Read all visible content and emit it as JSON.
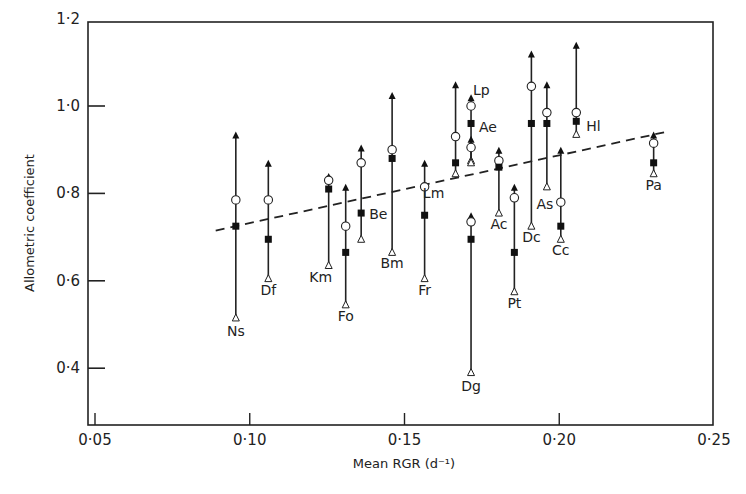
{
  "chart_data": {
    "type": "scatter",
    "title": "",
    "xlabel": "Mean RGR (d⁻¹)",
    "ylabel": "Allometric coefficient",
    "xlim": [
      0.048,
      0.25
    ],
    "ylim": [
      0.28,
      1.2
    ],
    "x_ticks": [
      0.05,
      0.1,
      0.15,
      0.2,
      0.25
    ],
    "x_tick_labels": [
      "0·05",
      "0·10",
      "0·15",
      "0·20",
      "0·25"
    ],
    "y_ticks": [
      0.4,
      0.6,
      0.8,
      1.0,
      1.2
    ],
    "y_tick_labels": [
      "0·4",
      "0·6",
      "0·8",
      "1·0",
      "1·2"
    ],
    "grid": false,
    "legend": null,
    "markers": {
      "upper": "filled-up-triangle",
      "circle": "open-circle",
      "square": "filled-square",
      "lower": "open-up-triangle"
    },
    "series": [
      {
        "name": "Ns",
        "x": 0.0955,
        "upper": 0.935,
        "circle": 0.785,
        "square": 0.725,
        "lower": 0.515
      },
      {
        "name": "Df",
        "x": 0.106,
        "upper": 0.87,
        "circle": 0.785,
        "square": 0.695,
        "lower": 0.605
      },
      {
        "name": "Km",
        "x": 0.1255,
        "upper": 0.84,
        "circle": 0.83,
        "square": 0.81,
        "lower": 0.635
      },
      {
        "name": "Fo",
        "x": 0.131,
        "upper": 0.815,
        "circle": 0.725,
        "square": 0.665,
        "lower": 0.545
      },
      {
        "name": "Be",
        "x": 0.136,
        "upper": 0.905,
        "circle": 0.87,
        "square": 0.755,
        "lower": 0.695
      },
      {
        "name": "Bm",
        "x": 0.146,
        "upper": 1.025,
        "circle": 0.9,
        "square": 0.88,
        "lower": 0.665
      },
      {
        "name": "Fr",
        "x": 0.1565,
        "upper": 0.87,
        "circle": 0.815,
        "square": 0.75,
        "lower": 0.605
      },
      {
        "name": "Lm",
        "x": 0.1665,
        "upper": 1.05,
        "circle": 0.93,
        "square": 0.87,
        "lower": 0.845
      },
      {
        "name": "Lp",
        "x": 0.1715,
        "upper": 1.02,
        "circle": 1.0,
        "square": 0.96,
        "lower": 0.875
      },
      {
        "name": "Ae",
        "x": 0.1715,
        "upper": 0.925,
        "circle": 0.905,
        "square": null,
        "lower": 0.87
      },
      {
        "name": "Dg",
        "x": 0.1715,
        "upper": 0.75,
        "circle": 0.735,
        "square": 0.695,
        "lower": 0.39
      },
      {
        "name": "Ac",
        "x": 0.1805,
        "upper": 0.9,
        "circle": 0.875,
        "square": 0.86,
        "lower": 0.755
      },
      {
        "name": "Pt",
        "x": 0.1855,
        "upper": 0.815,
        "circle": 0.79,
        "square": 0.665,
        "lower": 0.575
      },
      {
        "name": "Dc",
        "x": 0.191,
        "upper": 1.12,
        "circle": 1.045,
        "square": 0.96,
        "lower": 0.725
      },
      {
        "name": "As",
        "x": 0.196,
        "upper": 1.05,
        "circle": 0.985,
        "square": 0.96,
        "lower": 0.815
      },
      {
        "name": "Cc",
        "x": 0.2005,
        "upper": 0.9,
        "circle": 0.78,
        "square": 0.725,
        "lower": 0.695
      },
      {
        "name": "Hl",
        "x": 0.2055,
        "upper": 1.14,
        "circle": 0.985,
        "square": 0.965,
        "lower": 0.935
      },
      {
        "name": "Pa",
        "x": 0.2305,
        "upper": 0.935,
        "circle": 0.915,
        "square": 0.87,
        "lower": 0.845
      }
    ],
    "regression_line": {
      "style": "dashed",
      "x": [
        0.089,
        0.234
      ],
      "y": [
        0.715,
        0.94
      ]
    }
  }
}
